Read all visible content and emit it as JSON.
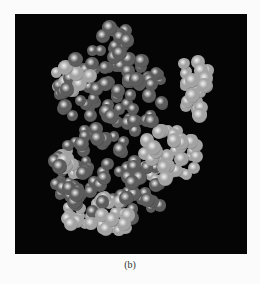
{
  "figure": {
    "caption": "(b)",
    "panel_background": "#050505",
    "page_background": "#fbfbfb",
    "colors": {
      "dark_atom": "#5c5c5c",
      "light_atom": "#a3a3a3",
      "highlight": "#f2f2f2"
    },
    "regions": [
      {
        "tone": "dark",
        "cx": 110,
        "cy": 95,
        "rx": 55,
        "ry": 50,
        "n": 90
      },
      {
        "tone": "dark",
        "cx": 95,
        "cy": 175,
        "rx": 45,
        "ry": 38,
        "n": 60
      },
      {
        "tone": "dark",
        "cx": 140,
        "cy": 190,
        "rx": 25,
        "ry": 30,
        "n": 25
      },
      {
        "tone": "dark",
        "cx": 115,
        "cy": 40,
        "rx": 14,
        "ry": 16,
        "n": 12
      },
      {
        "tone": "light",
        "cx": 70,
        "cy": 80,
        "rx": 22,
        "ry": 14,
        "n": 18
      },
      {
        "tone": "light",
        "cx": 195,
        "cy": 85,
        "rx": 14,
        "ry": 35,
        "n": 25
      },
      {
        "tone": "light",
        "cx": 170,
        "cy": 155,
        "rx": 30,
        "ry": 30,
        "n": 45
      },
      {
        "tone": "light",
        "cx": 100,
        "cy": 215,
        "rx": 40,
        "ry": 18,
        "n": 35
      },
      {
        "tone": "light",
        "cx": 70,
        "cy": 165,
        "rx": 12,
        "ry": 15,
        "n": 10
      }
    ]
  }
}
